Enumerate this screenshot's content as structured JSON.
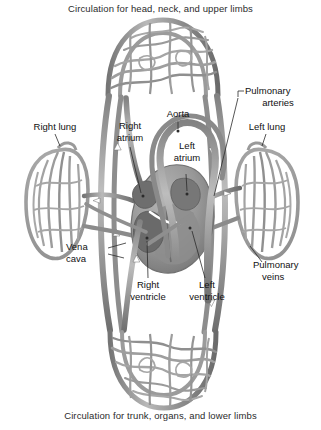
{
  "figure": {
    "type": "anatomical-diagram",
    "caption_top": "Circulation for head, neck, and upper limbs",
    "caption_bottom": "Circulation for trunk, organs, and lower limbs"
  },
  "labels": {
    "right_lung": "Right lung",
    "left_lung": "Left lung",
    "aorta": "Aorta",
    "right_atrium_l1": "Right",
    "right_atrium_l2": "atrium",
    "left_atrium_l1": "Left",
    "left_atrium_l2": "atrium",
    "pulmonary_arteries_l1": "Pulmonary",
    "pulmonary_arteries_l2": "arteries",
    "pulmonary_veins_l1": "Pulmonary",
    "pulmonary_veins_l2": "veins",
    "vena_cava_l1": "Vena",
    "vena_cava_l2": "cava",
    "right_ventricle_l1": "Right",
    "right_ventricle_l2": "ventricle",
    "left_ventricle_l1": "Left",
    "left_ventricle_l2": "ventricle"
  },
  "colors": {
    "background": "#ffffff",
    "vessel_mid": "#8c8c8c",
    "vessel_dark": "#6e6e6e",
    "vessel_light": "#b5b5b5",
    "vessel_outline": "#5a5a5a",
    "heart_body": "#9a9a9a",
    "heart_shade": "#808080",
    "chamber_dark": "#5e5e5e",
    "text": "#111111",
    "caption_text": "#2b2b2b",
    "leader_line": "#2b2b2b",
    "arrow_white": "#ffffff"
  },
  "structures": [
    {
      "name": "upper-capillary-bed",
      "description": "Arched capillary network at top representing head, neck and upper limb circulation"
    },
    {
      "name": "lower-capillary-bed",
      "description": "Inverted arched capillary network at bottom representing trunk, organs and lower limb circulation"
    },
    {
      "name": "right-lung",
      "description": "Left-side oval pulmonary capillary network"
    },
    {
      "name": "left-lung",
      "description": "Right-side oval pulmonary capillary network"
    },
    {
      "name": "heart",
      "description": "Central heart mass with four chambers"
    },
    {
      "name": "aorta-arch",
      "description": "Large arch vessel leaving the left ventricle"
    },
    {
      "name": "vena-cava",
      "description": "Great veins returning blood to the right atrium"
    },
    {
      "name": "pulmonary-arteries",
      "description": "Vessels carrying blood from right ventricle to the lungs"
    },
    {
      "name": "pulmonary-veins",
      "description": "Vessels carrying blood from lungs to left atrium"
    }
  ]
}
